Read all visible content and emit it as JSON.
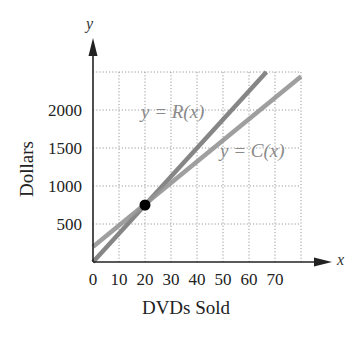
{
  "chart_data": {
    "type": "line",
    "title": "",
    "xlabel": "DVDs Sold",
    "ylabel": "Dollars",
    "x_axis_var": "x",
    "y_axis_var": "y",
    "xlim": [
      0,
      80
    ],
    "ylim": [
      0,
      2500
    ],
    "x_ticks": [
      0,
      10,
      20,
      30,
      40,
      50,
      60,
      70
    ],
    "y_ticks": [
      500,
      1000,
      1500,
      2000
    ],
    "grid": true,
    "grid_style": "dotted",
    "series": [
      {
        "name": "y = R(x)",
        "intercept": 0,
        "slope": 37.5,
        "points": [
          [
            0,
            0
          ],
          [
            66.7,
            2500
          ]
        ],
        "color": "#7a7a7a"
      },
      {
        "name": "y = C(x)",
        "intercept": 200,
        "slope": 28,
        "points": [
          [
            0,
            200
          ],
          [
            80,
            2440
          ]
        ],
        "color": "#8f8f8f"
      }
    ],
    "annotations": [
      {
        "type": "point",
        "label": "break-even",
        "x": 20,
        "y": 750,
        "color": "#000000"
      }
    ]
  },
  "labels": {
    "xlabel": "DVDs Sold",
    "ylabel": "Dollars",
    "x_var": "x",
    "y_var": "y",
    "r_label": "y = R(x)",
    "c_label": "y = C(x)"
  },
  "colors": {
    "axis": "#222222",
    "grid": "#9a9a9a",
    "r_line": "#7a7a7a",
    "c_line": "#959595",
    "label": "#8a8a8a",
    "point": "#000000"
  }
}
